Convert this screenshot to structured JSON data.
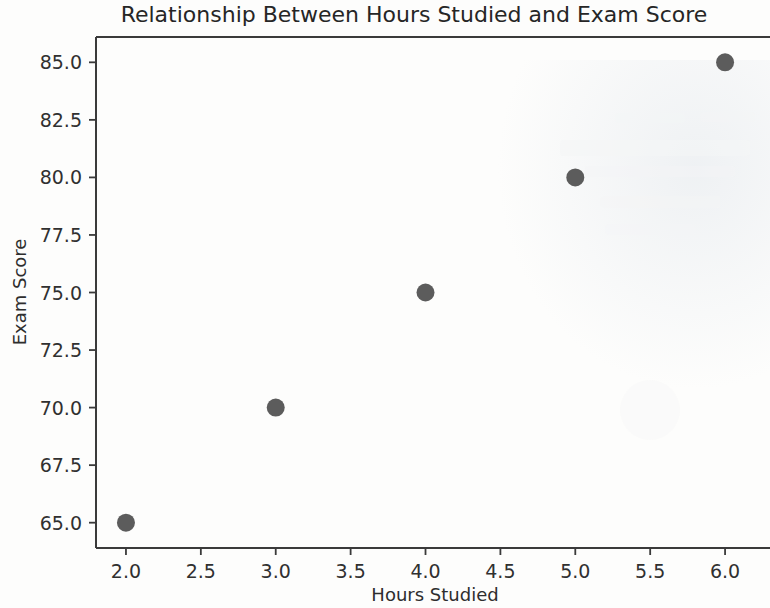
{
  "figure": {
    "title": "Relationship Between Hours Studied and Exam Score",
    "background_color": "#fdfdfc",
    "marker_color": "#5c5c5c",
    "axis_color": "#3a3a3a"
  },
  "axes": {
    "x_label": "Hours Studied",
    "y_label": "Exam Score",
    "x_ticks": [
      "2.0",
      "2.5",
      "3.0",
      "3.5",
      "4.0",
      "4.5",
      "5.0",
      "5.5",
      "6.0"
    ],
    "y_ticks": [
      "65.0",
      "67.5",
      "70.0",
      "72.5",
      "75.0",
      "77.5",
      "80.0",
      "82.5",
      "85.0"
    ]
  },
  "chart_data": {
    "type": "scatter",
    "title": "Relationship Between Hours Studied and Exam Score",
    "xlabel": "Hours Studied",
    "ylabel": "Exam Score",
    "x": [
      2,
      3,
      4,
      5,
      6
    ],
    "y": [
      65,
      70,
      75,
      80,
      85
    ],
    "points": [
      {
        "x": 2,
        "y": 65
      },
      {
        "x": 3,
        "y": 70
      },
      {
        "x": 4,
        "y": 75
      },
      {
        "x": 5,
        "y": 80
      },
      {
        "x": 6,
        "y": 85
      }
    ],
    "xlim": [
      1.8,
      6.3
    ],
    "ylim": [
      63.9,
      86.1
    ],
    "xticks": [
      2.0,
      2.5,
      3.0,
      3.5,
      4.0,
      4.5,
      5.0,
      5.5,
      6.0
    ],
    "yticks": [
      65.0,
      67.5,
      70.0,
      72.5,
      75.0,
      77.5,
      80.0,
      82.5,
      85.0
    ],
    "grid": false,
    "legend": null,
    "marker_color": "#5c5c5c",
    "marker_size": 9,
    "series": [
      {
        "name": "Students",
        "x": [
          2,
          3,
          4,
          5,
          6
        ],
        "values": [
          65,
          70,
          75,
          80,
          85
        ]
      }
    ]
  }
}
